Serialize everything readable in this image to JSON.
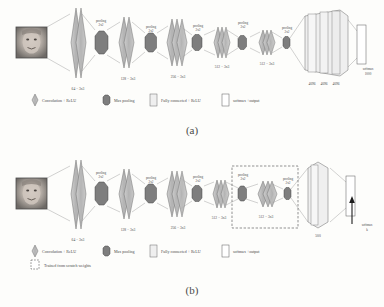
{
  "figure": {
    "panels": [
      {
        "id": "a",
        "caption": "(a)",
        "input": {
          "name": "face-thumbnail",
          "alt": "grayscale face photo"
        },
        "blocks": [
          {
            "type": "conv",
            "label": "64 − 3x3",
            "layers": 2
          },
          {
            "type": "pool",
            "label": "pooling\n2x2",
            "line1": "pooling",
            "line2": "2x2"
          },
          {
            "type": "conv",
            "label": "128 − 3x3",
            "layers": 2
          },
          {
            "type": "pool",
            "line1": "pooling",
            "line2": "2x2"
          },
          {
            "type": "conv",
            "label": "256 − 3x3",
            "layers": 3
          },
          {
            "type": "pool",
            "line1": "pooling",
            "line2": "2x2"
          },
          {
            "type": "conv",
            "label": "512 − 3x3",
            "layers": 3
          },
          {
            "type": "pool",
            "line1": "pooling",
            "line2": "2x2"
          },
          {
            "type": "conv",
            "label": "512 − 3x3",
            "layers": 3
          },
          {
            "type": "pool",
            "line1": "pooling",
            "line2": "2x2"
          }
        ],
        "fc": [
          {
            "label": "4096"
          },
          {
            "label": "4096"
          },
          {
            "label": "4096"
          }
        ],
        "output": {
          "line1": "softmax",
          "line2": "1000"
        },
        "legend": [
          {
            "shape": "diamond",
            "label": "Convolution + ReLU"
          },
          {
            "shape": "hexagon",
            "label": "Max pooling"
          },
          {
            "shape": "rect-light",
            "label": "Fully connected + ReLU"
          },
          {
            "shape": "rect-white",
            "label": "softmax +output"
          }
        ]
      },
      {
        "id": "b",
        "caption": "(b)",
        "input": {
          "name": "face-thumbnail",
          "alt": "grayscale face photo"
        },
        "blocks": [
          {
            "type": "conv",
            "label": "64 − 3x3",
            "layers": 2
          },
          {
            "type": "pool",
            "line1": "pooling",
            "line2": "2x2"
          },
          {
            "type": "conv",
            "label": "128 − 3x3",
            "layers": 2
          },
          {
            "type": "pool",
            "line1": "pooling",
            "line2": "2x2"
          },
          {
            "type": "conv",
            "label": "256 − 3x3",
            "layers": 3
          },
          {
            "type": "pool",
            "line1": "pooling",
            "line2": "2x2"
          },
          {
            "type": "conv",
            "label": "512 − 3x3",
            "layers": 3
          },
          {
            "type": "pool",
            "line1": "pooling",
            "line2": "2x2",
            "in_box": true
          },
          {
            "type": "conv",
            "label": "512 − 3x3",
            "layers": 3,
            "in_box": true
          },
          {
            "type": "pool",
            "line1": "pooling",
            "line2": "2x2",
            "in_box": true
          }
        ],
        "scratch_box": {
          "name": "trained-from-scratch-region",
          "dashed": true
        },
        "fc": [
          {
            "label": "500"
          }
        ],
        "output": {
          "line1": "softmax",
          "line2": "k"
        },
        "arrow": {
          "name": "softmax-arrow"
        },
        "legend": [
          {
            "shape": "diamond",
            "label": "Convolution + ReLU"
          },
          {
            "shape": "hexagon",
            "label": "Max pooling"
          },
          {
            "shape": "rect-light",
            "label": "Fully connected + ReLU"
          },
          {
            "shape": "rect-white",
            "label": "softmax +output"
          },
          {
            "shape": "rect-dashed",
            "label": "Trained from scratch weights"
          }
        ]
      }
    ],
    "colors": {
      "conv_fill": "#b9b9b9",
      "conv_stroke": "#6f6f6f",
      "pool_fill": "#7e7e7e",
      "pool_stroke": "#4a4a4a",
      "fc_fill": "#efefef",
      "fc_stroke": "#6a6a6a",
      "out_fill": "#ffffff",
      "out_stroke": "#5a5a5a",
      "line": "#8d8d8d",
      "text": "#4b4b4b",
      "background": "#fdfdfb"
    }
  }
}
